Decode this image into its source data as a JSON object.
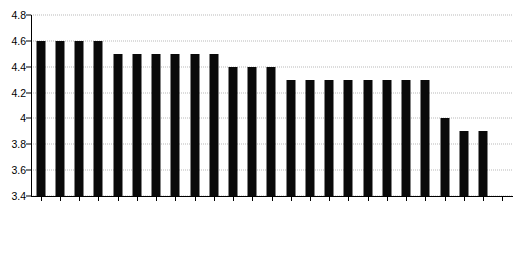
{
  "chart_data": {
    "type": "bar",
    "title": "",
    "subtitle": "",
    "xlabel": "",
    "ylabel": "",
    "ylim": [
      3.4,
      4.8
    ],
    "ytick_labels": [
      "4.8",
      "4.6",
      "4.4",
      "4.2",
      "4",
      "3.8",
      "3.6",
      "3.4"
    ],
    "ytick_values": [
      4.8,
      4.6,
      4.4,
      4.2,
      4.0,
      3.8,
      3.6,
      3.4
    ],
    "grid": true,
    "grid_style": "dotted",
    "legend": false,
    "bar_color": "#0a0a0a",
    "categories": [
      "Belgium",
      "Greece",
      "Nigeria",
      "Portugal",
      "Austria",
      "Colombia",
      "Finland",
      "Italy",
      "Slovenia",
      "Switzerland",
      "Germany",
      "Malawi",
      "Russia",
      "China",
      "Estonia",
      "India",
      "Mexico",
      "Norway",
      "Pakistan",
      "Serbia",
      "Slovakia",
      "Japan",
      "Argentina",
      "Korea"
    ],
    "values": [
      4.6,
      4.6,
      4.6,
      4.6,
      4.5,
      4.5,
      4.5,
      4.5,
      4.5,
      4.5,
      4.4,
      4.4,
      4.4,
      4.3,
      4.3,
      4.3,
      4.3,
      4.3,
      4.3,
      4.3,
      4.3,
      4.0,
      3.9,
      3.9
    ],
    "n_slots": 25
  }
}
